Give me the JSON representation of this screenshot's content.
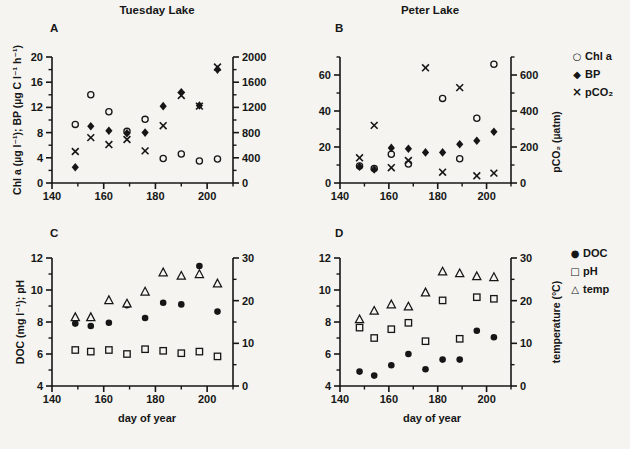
{
  "figure": {
    "left_column_title": "Tuesday Lake",
    "right_column_title": "Peter Lake",
    "x_axis_label": "day of year",
    "background": "#f5f4f0",
    "ink": "#161616"
  },
  "legends": {
    "top": [
      {
        "marker": "open-circle",
        "label": "Chl a"
      },
      {
        "marker": "filled-diamond",
        "label": "BP"
      },
      {
        "marker": "x-cross",
        "label": "pCO₂"
      }
    ],
    "bottom": [
      {
        "marker": "filled-circle",
        "label": "DOC"
      },
      {
        "marker": "open-square",
        "label": "pH"
      },
      {
        "marker": "open-triangle",
        "label": "temp"
      }
    ]
  },
  "chart_data": [
    {
      "id": "A",
      "panel_label": "A",
      "lake": "Tuesday Lake",
      "type": "scatter",
      "x_label": "",
      "xlim": [
        140,
        210
      ],
      "x_ticks_major": [
        140,
        160,
        180,
        200
      ],
      "x_ticks_minor": [
        150,
        170,
        190,
        210
      ],
      "left_axis": {
        "label": "Chl a (µg l⁻¹); BP (µg C l⁻¹ h⁻¹)",
        "lim": [
          0,
          20
        ],
        "ticks_major": [
          0,
          4,
          8,
          12,
          16,
          20
        ],
        "ticks_minor": [
          2,
          6,
          10,
          14,
          18
        ]
      },
      "right_axis": {
        "label": "",
        "lim": [
          0,
          2000
        ],
        "ticks_major": [
          0,
          400,
          800,
          1200,
          1600,
          2000
        ],
        "ticks_minor": [
          200,
          600,
          1000,
          1400,
          1800
        ]
      },
      "x": [
        149,
        155,
        162,
        169,
        176,
        183,
        190,
        197,
        204
      ],
      "series": [
        {
          "name": "Chl a",
          "marker": "open-circle",
          "axis": "left",
          "values": [
            9.3,
            14.0,
            11.3,
            8.2,
            10.1,
            3.9,
            4.6,
            3.5,
            3.8
          ]
        },
        {
          "name": "BP",
          "marker": "filled-diamond",
          "axis": "left",
          "values": [
            2.5,
            9.0,
            8.3,
            7.9,
            8.0,
            12.2,
            14.4,
            12.3,
            18.0
          ]
        },
        {
          "name": "pCO₂",
          "marker": "x-cross",
          "axis": "right",
          "values": [
            500,
            720,
            610,
            690,
            510,
            910,
            1390,
            1220,
            1840
          ]
        }
      ]
    },
    {
      "id": "B",
      "panel_label": "B",
      "lake": "Peter Lake",
      "type": "scatter",
      "x_label": "",
      "xlim": [
        140,
        210
      ],
      "x_ticks_major": [
        140,
        160,
        180,
        200
      ],
      "x_ticks_minor": [
        150,
        170,
        190,
        210
      ],
      "left_axis": {
        "label": "",
        "lim": [
          0,
          70
        ],
        "ticks_major": [
          0,
          20,
          40,
          60
        ],
        "ticks_minor": [
          10,
          30,
          50,
          70
        ]
      },
      "right_axis": {
        "label": "pCO₂ (µatm)",
        "lim": [
          0,
          700
        ],
        "ticks_major": [
          0,
          200,
          400,
          600
        ],
        "ticks_minor": [
          100,
          300,
          500,
          700
        ]
      },
      "x": [
        148,
        154,
        161,
        168,
        175,
        182,
        189,
        196,
        203
      ],
      "series": [
        {
          "name": "Chl a",
          "marker": "open-circle",
          "axis": "left",
          "values": [
            9.5,
            8.0,
            16.0,
            10.5,
            null,
            47.0,
            13.5,
            36.0,
            66.0
          ]
        },
        {
          "name": "BP",
          "marker": "filled-diamond",
          "axis": "left",
          "values": [
            9.0,
            7.5,
            19.5,
            19.0,
            17.0,
            17.0,
            21.5,
            23.5,
            28.5
          ]
        },
        {
          "name": "pCO₂",
          "marker": "x-cross",
          "axis": "right",
          "values": [
            140,
            320,
            85,
            125,
            640,
            60,
            530,
            40,
            55
          ]
        }
      ]
    },
    {
      "id": "C",
      "panel_label": "C",
      "lake": "Tuesday Lake",
      "type": "scatter",
      "x_label": "day of year",
      "xlim": [
        140,
        210
      ],
      "x_ticks_major": [
        140,
        160,
        180,
        200
      ],
      "x_ticks_minor": [
        150,
        170,
        190,
        210
      ],
      "left_axis": {
        "label": "DOC (mg l⁻¹); pH",
        "lim": [
          4,
          12
        ],
        "ticks_major": [
          4,
          6,
          8,
          10,
          12
        ],
        "ticks_minor": [
          5,
          7,
          9,
          11
        ]
      },
      "right_axis": {
        "label": "",
        "lim": [
          0,
          30
        ],
        "ticks_major": [
          0,
          10,
          20,
          30
        ],
        "ticks_minor": [
          5,
          15,
          25
        ]
      },
      "x": [
        149,
        155,
        162,
        169,
        176,
        183,
        190,
        197,
        204
      ],
      "series": [
        {
          "name": "DOC",
          "marker": "filled-circle",
          "axis": "left",
          "values": [
            7.9,
            7.75,
            7.95,
            9.05,
            8.25,
            9.2,
            9.1,
            11.5,
            8.65
          ]
        },
        {
          "name": "pH",
          "marker": "open-square",
          "axis": "left",
          "values": [
            6.25,
            6.15,
            6.25,
            6.0,
            6.3,
            6.2,
            6.05,
            6.15,
            5.85
          ]
        },
        {
          "name": "temp",
          "marker": "open-triangle",
          "axis": "right",
          "values": [
            16.1,
            16.1,
            20.1,
            19.3,
            22.1,
            26.6,
            25.8,
            26.2,
            24.0
          ]
        }
      ]
    },
    {
      "id": "D",
      "panel_label": "D",
      "lake": "Peter Lake",
      "type": "scatter",
      "x_label": "day of year",
      "xlim": [
        140,
        210
      ],
      "x_ticks_major": [
        140,
        160,
        180,
        200
      ],
      "x_ticks_minor": [
        150,
        170,
        190,
        210
      ],
      "left_axis": {
        "label": "",
        "lim": [
          4,
          12
        ],
        "ticks_major": [
          4,
          6,
          8,
          10,
          12
        ],
        "ticks_minor": [
          5,
          7,
          9,
          11
        ]
      },
      "right_axis": {
        "label": "temperature (°C)",
        "lim": [
          0,
          30
        ],
        "ticks_major": [
          0,
          10,
          20,
          30
        ],
        "ticks_minor": [
          5,
          15,
          25
        ]
      },
      "x": [
        148,
        154,
        161,
        168,
        175,
        182,
        189,
        196,
        203
      ],
      "series": [
        {
          "name": "DOC",
          "marker": "filled-circle",
          "axis": "left",
          "values": [
            4.9,
            4.65,
            5.3,
            6.0,
            5.05,
            5.65,
            5.65,
            7.45,
            7.05
          ]
        },
        {
          "name": "pH",
          "marker": "open-square",
          "axis": "left",
          "values": [
            7.65,
            7.0,
            7.55,
            7.95,
            6.8,
            9.35,
            6.95,
            9.55,
            9.45
          ]
        },
        {
          "name": "temp",
          "marker": "open-triangle",
          "axis": "right",
          "values": [
            15.6,
            17.6,
            19.1,
            18.6,
            21.9,
            26.8,
            26.4,
            25.7,
            25.5
          ]
        }
      ]
    }
  ]
}
